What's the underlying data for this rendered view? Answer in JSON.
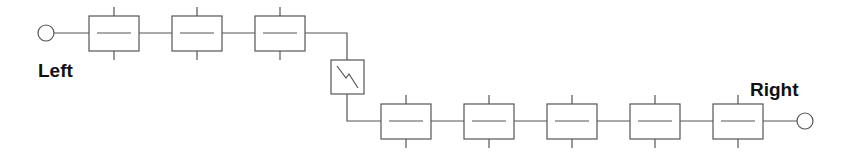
{
  "labels": {
    "left": "Left",
    "right": "Right"
  },
  "colors": {
    "stroke": "#555555",
    "text": "#111111",
    "background": "#ffffff"
  },
  "top_row": {
    "element_count": 3,
    "element_type": "series-block"
  },
  "switch": {
    "icon": "lightning-switch-icon"
  },
  "bottom_row": {
    "element_count": 5,
    "element_type": "series-block"
  },
  "terminals": [
    "left-terminal-circle",
    "right-terminal-circle"
  ]
}
